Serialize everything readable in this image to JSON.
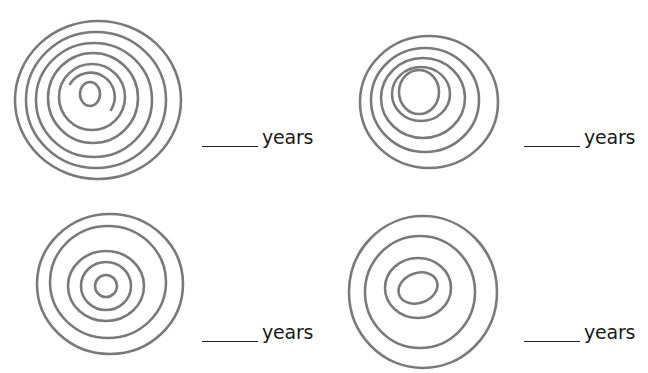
{
  "worksheet": {
    "items": [
      {
        "id": "tree-1",
        "rings": 7,
        "answer_blank": "",
        "unit": "years"
      },
      {
        "id": "tree-2",
        "rings": 5,
        "answer_blank": "",
        "unit": "years"
      },
      {
        "id": "tree-3",
        "rings": 5,
        "answer_blank": "",
        "unit": "years"
      },
      {
        "id": "tree-4",
        "rings": 4,
        "answer_blank": "",
        "unit": "years"
      }
    ],
    "colors": {
      "ring": "#7a7a7a",
      "text": "#1a1a1a",
      "background": "#ffffff"
    }
  }
}
